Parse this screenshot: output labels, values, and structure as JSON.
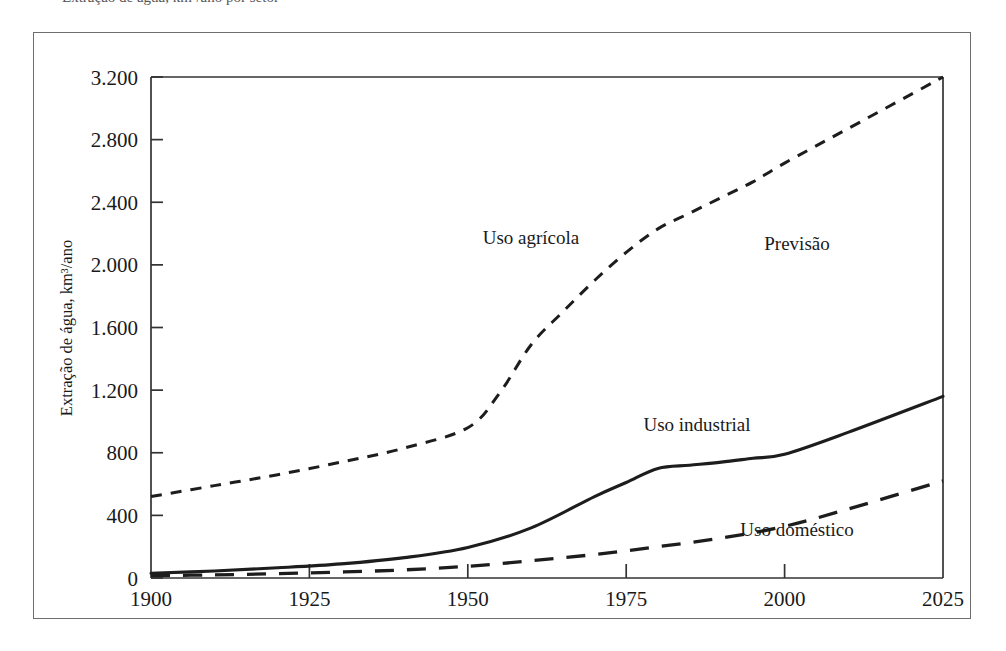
{
  "caption": {
    "text": "Extração de água, km³/ano por setor"
  },
  "chart_data": {
    "type": "line",
    "title": "",
    "subtitle": "",
    "xlabel": "",
    "ylabel": "Extração de água, km³/ano",
    "xlim": [
      1900,
      2025
    ],
    "ylim": [
      0,
      3200
    ],
    "xticks": [
      1900,
      1925,
      1950,
      1975,
      2000,
      2025
    ],
    "xtick_labels": [
      "1900",
      "1925",
      "1950",
      "1975",
      "2000",
      "2025"
    ],
    "yticks": [
      0,
      400,
      800,
      1200,
      1600,
      2000,
      2400,
      2800,
      3200
    ],
    "ytick_labels": [
      "0",
      "400",
      "800",
      "1.200",
      "1.600",
      "2.000",
      "2.400",
      "2.800",
      "3.200"
    ],
    "grid": false,
    "legend": "inline-annotations",
    "series": [
      {
        "name": "Uso agrícola",
        "style": "dashed-short",
        "color": "#1d1d1d",
        "x": [
          1900,
          1910,
          1920,
          1930,
          1940,
          1950,
          1955,
          1960,
          1965,
          1970,
          1975,
          1980,
          1985,
          1990,
          1995,
          2000,
          2010,
          2025
        ],
        "values": [
          520,
          590,
          660,
          740,
          830,
          960,
          1180,
          1490,
          1700,
          1900,
          2080,
          2230,
          2330,
          2430,
          2530,
          2650,
          2870,
          3200
        ]
      },
      {
        "name": "Uso industrial",
        "style": "solid",
        "color": "#1d1d1d",
        "x": [
          1900,
          1910,
          1920,
          1930,
          1940,
          1950,
          1960,
          1970,
          1975,
          1980,
          1985,
          1990,
          1995,
          2000,
          2010,
          2025
        ],
        "values": [
          30,
          45,
          65,
          90,
          130,
          195,
          320,
          520,
          610,
          700,
          720,
          740,
          765,
          790,
          930,
          1160
        ]
      },
      {
        "name": "Uso doméstico",
        "style": "dashed-long",
        "color": "#1d1d1d",
        "x": [
          1900,
          1910,
          1920,
          1930,
          1940,
          1950,
          1960,
          1970,
          1980,
          1990,
          2000,
          2010,
          2025
        ],
        "values": [
          15,
          20,
          28,
          38,
          52,
          75,
          110,
          150,
          200,
          255,
          330,
          440,
          620
        ]
      }
    ],
    "annotations": [
      {
        "label": "Uso agrícola",
        "x_px": 531,
        "y_px": 244
      },
      {
        "label": "Previsão",
        "x_px": 797,
        "y_px": 250
      },
      {
        "label": "Uso industrial",
        "x_px": 697,
        "y_px": 431
      },
      {
        "label": "Uso doméstico",
        "x_px": 797,
        "y_px": 536
      }
    ]
  }
}
